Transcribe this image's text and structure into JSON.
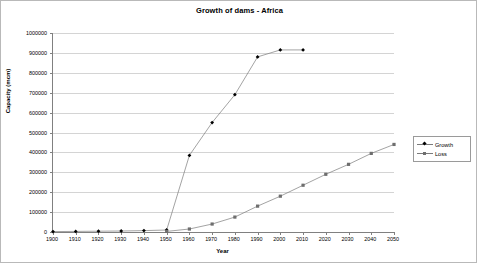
{
  "chart_data": {
    "type": "line",
    "title": "Growth of dams - Africa",
    "xlabel": "Year",
    "ylabel": "Capacity (mcm)",
    "xlim": [
      1900,
      2050
    ],
    "ylim": [
      0,
      1000000
    ],
    "grid": true,
    "legend_position": "right",
    "x": [
      1900,
      1910,
      1920,
      1930,
      1940,
      1950,
      1960,
      1970,
      1980,
      1990,
      2000,
      2010,
      2020,
      2030,
      2040,
      2050
    ],
    "xticks": [
      "1900",
      "1910",
      "1920",
      "1930",
      "1940",
      "1950",
      "1960",
      "1970",
      "1980",
      "1990",
      "2000",
      "2010",
      "2020",
      "2030",
      "2040",
      "2050"
    ],
    "yticks": [
      "0",
      "100000",
      "200000",
      "300000",
      "400000",
      "500000",
      "600000",
      "700000",
      "800000",
      "900000",
      "1000000"
    ],
    "ytick_values": [
      0,
      100000,
      200000,
      300000,
      400000,
      500000,
      600000,
      700000,
      800000,
      900000,
      1000000
    ],
    "series": [
      {
        "name": "Growth",
        "marker": "diamond",
        "color": "#000000",
        "x": [
          1900,
          1910,
          1920,
          1930,
          1940,
          1950,
          1960,
          1970,
          1980,
          1990,
          2000,
          2010
        ],
        "values": [
          2000,
          3000,
          4000,
          5000,
          7000,
          10000,
          385000,
          550000,
          690000,
          880000,
          915000,
          915000
        ]
      },
      {
        "name": "Loss",
        "marker": "square",
        "color": "#6e6e6e",
        "x": [
          1950,
          1960,
          1970,
          1980,
          1990,
          2000,
          2010,
          2020,
          2030,
          2040,
          2050
        ],
        "values": [
          3000,
          15000,
          40000,
          75000,
          130000,
          180000,
          235000,
          290000,
          340000,
          395000,
          440000
        ]
      }
    ]
  }
}
